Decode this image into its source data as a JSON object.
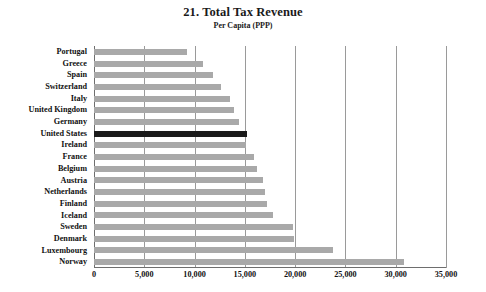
{
  "chart_data": {
    "type": "bar",
    "orientation": "horizontal",
    "title": "21. Total Tax Revenue",
    "subtitle": "Per Capita (PPP)",
    "xlabel": "",
    "ylabel": "",
    "xlim": [
      0,
      35000
    ],
    "xticks": [
      0,
      5000,
      10000,
      15000,
      20000,
      25000,
      30000,
      35000
    ],
    "xtick_labels": [
      "0",
      "5,000",
      "10,000",
      "15,000",
      "20,000",
      "25,000",
      "30,000",
      "35,000"
    ],
    "grid": "vertical",
    "legend": "none",
    "bar_color": "#a9a9a9",
    "highlight_color": "#1a1a1a",
    "highlight_category": "United States",
    "categories": [
      "Portugal",
      "Greece",
      "Spain",
      "Switzerland",
      "Italy",
      "United Kingdom",
      "Germany",
      "United States",
      "Ireland",
      "France",
      "Belgium",
      "Austria",
      "Netherlands",
      "Finland",
      "Iceland",
      "Sweden",
      "Denmark",
      "Luxembourg",
      "Norway"
    ],
    "values": [
      9200,
      10800,
      11800,
      12650,
      13550,
      13950,
      14450,
      15250,
      15150,
      15950,
      16250,
      16850,
      17050,
      17250,
      17750,
      19800,
      19850,
      23800,
      30850
    ]
  }
}
